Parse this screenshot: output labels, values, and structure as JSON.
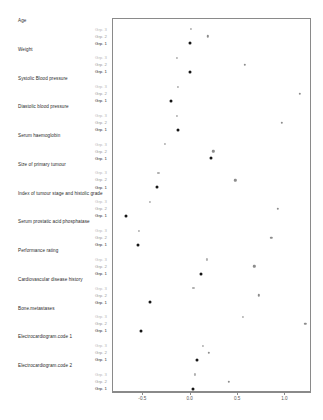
{
  "chart_data": {
    "type": "scatter",
    "title": "",
    "xlabel": "",
    "ylabel": "",
    "xlim": [
      -0.82,
      1.28
    ],
    "xticks": [
      -0.5,
      0.0,
      0.5,
      1.0
    ],
    "xticklabels": [
      "-0.5",
      "0.0",
      "0.5",
      "1.0"
    ],
    "grid": false,
    "legend": "none",
    "group_labels": [
      "Grp. 3",
      "Grp. 2",
      "Grp. 1"
    ],
    "categories": [
      "Age",
      "Weight",
      "Systolic Blood pressure",
      "Diastolic blood pressure",
      "Serum haemoglobin",
      "Size of primary tumour",
      "Index of tumour stage and histolic grade",
      "Serum prostatic acid phosphatase",
      "Performance rating",
      "Cardiovascular disease history",
      "Bone.metastases",
      "Electrocardiogram.code 1",
      "Electrocardiogram.code 2"
    ],
    "series": [
      {
        "name": "Grp. 3",
        "values": [
          0.01,
          -0.13,
          -0.12,
          -0.13,
          -0.26,
          -0.33,
          -0.42,
          -0.54,
          0.18,
          0.04,
          0.56,
          0.14,
          0.06
        ]
      },
      {
        "name": "Grp. 2",
        "values": [
          0.19,
          0.58,
          1.16,
          0.97,
          0.25,
          0.48,
          0.93,
          0.86,
          0.68,
          0.73,
          1.22,
          0.2,
          0.41
        ]
      },
      {
        "name": "Grp. 1",
        "values": [
          0.0,
          0.0,
          -0.2,
          -0.12,
          0.22,
          -0.35,
          -0.67,
          -0.55,
          0.12,
          -0.42,
          -0.51,
          0.08,
          0.04
        ]
      }
    ]
  },
  "colors": {
    "grp3": "#b0b0b0",
    "grp2": "#8c8c8c",
    "grp1": "#161616",
    "panel_border": "#8a8a8a",
    "axis": "#8a8a8a"
  }
}
